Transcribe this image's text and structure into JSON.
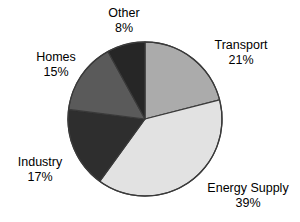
{
  "chart_data": {
    "type": "pie",
    "title": "",
    "subtitle": "",
    "xlabel": "",
    "ylabel": "",
    "legend_position": "none",
    "grid": false,
    "labels_inside": false,
    "start_angle_deg": 0,
    "direction": "clockwise",
    "categories": [
      "Transport",
      "Energy Supply",
      "Industry",
      "Homes",
      "Other"
    ],
    "values": [
      21,
      39,
      17,
      15,
      8
    ],
    "units": "%",
    "colors": [
      "#ABABAB",
      "#E2E2E2",
      "#2E2E2E",
      "#5A5A5A",
      "#262626"
    ],
    "slices": [
      {
        "name": "Transport",
        "value": 21,
        "value_label": "21%",
        "color": "#ABABAB",
        "start_deg": 0,
        "end_deg": 75.6
      },
      {
        "name": "Energy Supply",
        "value": 39,
        "value_label": "39%",
        "color": "#E2E2E2",
        "start_deg": 75.6,
        "end_deg": 216.0
      },
      {
        "name": "Industry",
        "value": 17,
        "value_label": "17%",
        "color": "#2E2E2E",
        "start_deg": 216.0,
        "end_deg": 277.2
      },
      {
        "name": "Homes",
        "value": 15,
        "value_label": "15%",
        "color": "#5A5A5A",
        "start_deg": 277.2,
        "end_deg": 331.2
      },
      {
        "name": "Other",
        "value": 8,
        "value_label": "8%",
        "color": "#262626",
        "start_deg": 331.2,
        "end_deg": 360.0
      }
    ]
  },
  "labels": {
    "other": {
      "name": "Other",
      "value": "8%"
    },
    "transport": {
      "name": "Transport",
      "value": "21%"
    },
    "homes": {
      "name": "Homes",
      "value": "15%"
    },
    "industry": {
      "name": "Industry",
      "value": "17%"
    },
    "energy": {
      "name": "Energy Supply",
      "value": "39%"
    }
  },
  "style": {
    "background": "#ffffff",
    "text_color": "#000000",
    "outline_color": "#3a3a3a"
  }
}
